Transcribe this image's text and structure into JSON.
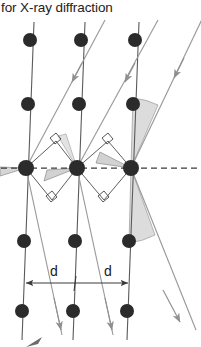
{
  "caption": {
    "text": "for X-ray diffraction",
    "clipped_line_above": true
  },
  "figure": {
    "colors": {
      "atom": "#2b2b2b",
      "lattice_line": "#555555",
      "ray": "#9a9a9a",
      "construction": "#555555",
      "dashed_axis": "#3a3a3a",
      "wedge_fill": "#d9d9d9",
      "background": "#ffffff"
    },
    "labels": [
      {
        "id": "d-left",
        "text": "d",
        "x": 54,
        "y": 274
      },
      {
        "id": "d-right",
        "text": "d",
        "x": 109,
        "y": 274
      }
    ],
    "lattice_planes": [
      {
        "id": "plane-1",
        "x_top": 34,
        "x_bottom": 24
      },
      {
        "id": "plane-2",
        "x_top": 85,
        "x_bottom": 75
      },
      {
        "id": "plane-3",
        "x_top": 139,
        "x_bottom": 129
      }
    ],
    "atoms": [
      {
        "row": 1,
        "col": 1,
        "cx": 30,
        "cy": 40
      },
      {
        "row": 1,
        "col": 2,
        "cx": 81,
        "cy": 40
      },
      {
        "row": 1,
        "col": 3,
        "cx": 135,
        "cy": 40
      },
      {
        "row": 2,
        "col": 1,
        "cx": 28,
        "cy": 104
      },
      {
        "row": 2,
        "col": 2,
        "cx": 79,
        "cy": 104
      },
      {
        "row": 2,
        "col": 3,
        "cx": 133,
        "cy": 104
      },
      {
        "row": 3,
        "col": 1,
        "cx": 26,
        "cy": 168
      },
      {
        "row": 3,
        "col": 2,
        "cx": 77,
        "cy": 168
      },
      {
        "row": 3,
        "col": 3,
        "cx": 131,
        "cy": 168
      },
      {
        "row": 4,
        "col": 1,
        "cx": 24,
        "cy": 241
      },
      {
        "row": 4,
        "col": 2,
        "cx": 75,
        "cy": 241
      },
      {
        "row": 4,
        "col": 3,
        "cx": 129,
        "cy": 241
      },
      {
        "row": 5,
        "col": 1,
        "cx": 22,
        "cy": 311
      },
      {
        "row": 5,
        "col": 2,
        "cx": 73,
        "cy": 311
      },
      {
        "row": 5,
        "col": 3,
        "cx": 127,
        "cy": 311
      }
    ],
    "atom_radius": 7,
    "incident_rays": [
      {
        "id": "incident-1",
        "x1": 105,
        "y1": 20,
        "x2": 26,
        "y2": 168,
        "arrow_at": 0.3
      },
      {
        "id": "incident-2",
        "x1": 158,
        "y1": 20,
        "x2": 77,
        "y2": 168,
        "arrow_at": 0.3
      },
      {
        "id": "incident-3",
        "x1": 201,
        "y1": 14,
        "x2": 131,
        "y2": 168,
        "arrow_at": 0.34
      }
    ],
    "diffracted_rays": [
      {
        "id": "diffracted-1",
        "x1": 26,
        "y1": 168,
        "x2": 61,
        "y2": 330,
        "arrow_at": 0.94
      },
      {
        "id": "diffracted-2",
        "x1": 77,
        "y1": 168,
        "x2": 112,
        "y2": 330,
        "arrow_at": 0.94
      },
      {
        "id": "diffracted-3",
        "x1": 131,
        "y1": 168,
        "x2": 185,
        "y2": 320,
        "arrow_at": 0.92
      }
    ],
    "dashed_axis": {
      "y": 168,
      "x1": 2,
      "x2": 199
    },
    "dimension_line": {
      "y": 283,
      "segments": [
        {
          "x1": 24,
          "x2": 76
        },
        {
          "x1": 76,
          "x2": 130
        }
      ]
    },
    "right_angle_marks": [
      {
        "id": "ra-1",
        "x": 48,
        "y": 147
      },
      {
        "id": "ra-2",
        "x": 43,
        "y": 195
      },
      {
        "id": "ra-3",
        "x": 99,
        "y": 147
      },
      {
        "id": "ra-4",
        "x": 95,
        "y": 195
      }
    ],
    "angle_wedges": [
      {
        "id": "theta-upper-left",
        "vertex_x": 77,
        "vertex_y": 168
      },
      {
        "id": "theta-lower-left",
        "vertex_x": 26,
        "vertex_y": 168
      },
      {
        "id": "theta-upper-right",
        "vertex_x": 131,
        "vertex_y": 168
      },
      {
        "id": "theta-lower-right",
        "vertex_x": 131,
        "vertex_y": 168
      }
    ]
  }
}
